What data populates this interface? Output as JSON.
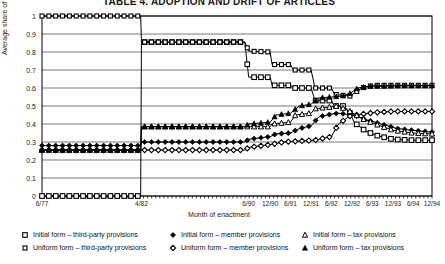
{
  "chart_data": {
    "type": "line",
    "title": "TABLE 4. ADOPTION AND DRIFT OF ARTICLES",
    "xlabel": "Month of enactment",
    "ylabel": "Average share of form",
    "ylim": [
      0,
      1
    ],
    "yticks": [
      "0",
      "0.1",
      "0.2",
      "0.3",
      "0.4",
      "0.5",
      "0.6",
      "0.7",
      "0.8",
      "0.9",
      "1"
    ],
    "x_tick_labels": [
      "6/77",
      "4/82",
      "6/90",
      "12/90",
      "6/91",
      "12/91",
      "6/92",
      "12/92",
      "6/93",
      "12/93",
      "6/94",
      "12/94"
    ],
    "x_tick_positions": [
      0.0,
      0.255,
      0.53,
      0.585,
      0.637,
      0.69,
      0.742,
      0.795,
      0.847,
      0.9,
      0.952,
      1.0
    ],
    "grid": "horizontal",
    "legend_position": "bottom",
    "series": [
      {
        "name": "Initial form – third-party provisions",
        "marker": "open-square",
        "points": [
          [
            0.0,
            0.0
          ],
          [
            0.253,
            0.0
          ],
          [
            0.255,
            0.855
          ],
          [
            0.52,
            0.855
          ],
          [
            0.53,
            0.66
          ],
          [
            0.585,
            0.66
          ],
          [
            0.59,
            0.615
          ],
          [
            0.637,
            0.615
          ],
          [
            0.645,
            0.6
          ],
          [
            0.69,
            0.6
          ],
          [
            0.7,
            0.53
          ],
          [
            0.742,
            0.53
          ],
          [
            0.75,
            0.5
          ],
          [
            0.775,
            0.5
          ],
          [
            0.79,
            0.46
          ],
          [
            0.8,
            0.41
          ],
          [
            0.83,
            0.36
          ],
          [
            0.86,
            0.335
          ],
          [
            0.9,
            0.315
          ],
          [
            0.95,
            0.31
          ],
          [
            1.0,
            0.31
          ]
        ]
      },
      {
        "name": "Uniform form – third-party provisions",
        "marker": "open-square-small",
        "points": [
          [
            0.0,
            1.0
          ],
          [
            0.253,
            1.0
          ],
          [
            0.255,
            0.855
          ],
          [
            0.52,
            0.855
          ],
          [
            0.53,
            0.805
          ],
          [
            0.585,
            0.8
          ],
          [
            0.59,
            0.73
          ],
          [
            0.637,
            0.73
          ],
          [
            0.645,
            0.7
          ],
          [
            0.69,
            0.7
          ],
          [
            0.7,
            0.6
          ],
          [
            0.742,
            0.6
          ],
          [
            0.75,
            0.565
          ],
          [
            0.79,
            0.555
          ],
          [
            0.82,
            0.6
          ],
          [
            0.85,
            0.615
          ],
          [
            0.9,
            0.615
          ],
          [
            0.95,
            0.615
          ],
          [
            1.0,
            0.615
          ]
        ]
      },
      {
        "name": "Initial form – member provisions",
        "marker": "filled-diamond",
        "points": [
          [
            0.0,
            0.28
          ],
          [
            0.253,
            0.28
          ],
          [
            0.255,
            0.3
          ],
          [
            0.52,
            0.3
          ],
          [
            0.53,
            0.315
          ],
          [
            0.585,
            0.33
          ],
          [
            0.6,
            0.345
          ],
          [
            0.637,
            0.35
          ],
          [
            0.66,
            0.375
          ],
          [
            0.69,
            0.39
          ],
          [
            0.71,
            0.44
          ],
          [
            0.742,
            0.455
          ],
          [
            0.76,
            0.46
          ],
          [
            0.8,
            0.45
          ],
          [
            0.83,
            0.425
          ],
          [
            0.87,
            0.4
          ],
          [
            0.91,
            0.375
          ],
          [
            0.95,
            0.365
          ],
          [
            1.0,
            0.355
          ]
        ]
      },
      {
        "name": "Uniform form – member provisions",
        "marker": "filled-diamond-open",
        "points": [
          [
            0.0,
            0.255
          ],
          [
            0.253,
            0.255
          ],
          [
            0.255,
            0.255
          ],
          [
            0.52,
            0.255
          ],
          [
            0.53,
            0.27
          ],
          [
            0.585,
            0.285
          ],
          [
            0.62,
            0.3
          ],
          [
            0.66,
            0.305
          ],
          [
            0.7,
            0.31
          ],
          [
            0.742,
            0.33
          ],
          [
            0.76,
            0.4
          ],
          [
            0.79,
            0.445
          ],
          [
            0.82,
            0.455
          ],
          [
            0.86,
            0.465
          ],
          [
            0.9,
            0.47
          ],
          [
            0.95,
            0.47
          ],
          [
            1.0,
            0.47
          ]
        ]
      },
      {
        "name": "Initial form – tax provisions",
        "marker": "open-triangle",
        "points": [
          [
            0.0,
            0.255
          ],
          [
            0.253,
            0.255
          ],
          [
            0.255,
            0.385
          ],
          [
            0.52,
            0.385
          ],
          [
            0.53,
            0.385
          ],
          [
            0.585,
            0.385
          ],
          [
            0.59,
            0.4
          ],
          [
            0.637,
            0.41
          ],
          [
            0.65,
            0.45
          ],
          [
            0.69,
            0.46
          ],
          [
            0.7,
            0.485
          ],
          [
            0.742,
            0.495
          ],
          [
            0.76,
            0.5
          ],
          [
            0.79,
            0.47
          ],
          [
            0.82,
            0.43
          ],
          [
            0.86,
            0.395
          ],
          [
            0.9,
            0.365
          ],
          [
            0.95,
            0.35
          ],
          [
            1.0,
            0.345
          ]
        ]
      },
      {
        "name": "Uniform form – tax provisions",
        "marker": "filled-triangle",
        "points": [
          [
            0.0,
            0.255
          ],
          [
            0.253,
            0.255
          ],
          [
            0.255,
            0.385
          ],
          [
            0.52,
            0.385
          ],
          [
            0.53,
            0.4
          ],
          [
            0.585,
            0.41
          ],
          [
            0.6,
            0.45
          ],
          [
            0.637,
            0.46
          ],
          [
            0.66,
            0.5
          ],
          [
            0.69,
            0.51
          ],
          [
            0.71,
            0.545
          ],
          [
            0.742,
            0.55
          ],
          [
            0.77,
            0.555
          ],
          [
            0.79,
            0.57
          ],
          [
            0.81,
            0.6
          ],
          [
            0.84,
            0.61
          ],
          [
            0.88,
            0.61
          ],
          [
            0.92,
            0.612
          ],
          [
            0.96,
            0.612
          ],
          [
            1.0,
            0.612
          ]
        ]
      }
    ]
  },
  "legend": {
    "columns": [
      [
        {
          "marker": "open-square",
          "label": "Initial form – third-party provisions"
        },
        {
          "marker": "open-square-small",
          "label": "Uniform form – third-party provisions"
        }
      ],
      [
        {
          "marker": "filled-diamond",
          "label": "Initial form – member provisions"
        },
        {
          "marker": "filled-diamond-open",
          "label": "Uniform form – member provisions"
        }
      ],
      [
        {
          "marker": "open-triangle",
          "label": "Initial form – tax provisions"
        },
        {
          "marker": "filled-triangle",
          "label": "Uniform form – tax provisions"
        }
      ]
    ]
  },
  "colors": {
    "line": "#000000",
    "grid": "#555555",
    "axis": "#000000",
    "background": "#ffffff"
  }
}
